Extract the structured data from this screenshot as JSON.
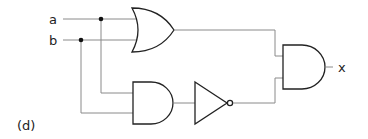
{
  "diagram": {
    "type": "logic-circuit",
    "panel_label": "(d)",
    "inputs": [
      {
        "name": "a"
      },
      {
        "name": "b"
      }
    ],
    "output": {
      "name": "x"
    },
    "gates": [
      {
        "id": "or1",
        "type": "OR",
        "inputs": [
          "a",
          "b"
        ]
      },
      {
        "id": "and1",
        "type": "AND",
        "inputs": [
          "a",
          "b"
        ]
      },
      {
        "id": "not1",
        "type": "NOT",
        "inputs": [
          "and1"
        ]
      },
      {
        "id": "and2",
        "type": "AND",
        "inputs": [
          "or1",
          "not1"
        ],
        "output": "x"
      }
    ],
    "expression": "x = (a + b) · ¬(a · b)",
    "colors": {
      "wire": "#8a8a8a",
      "gate": "#222222",
      "junction": "#111111"
    }
  }
}
